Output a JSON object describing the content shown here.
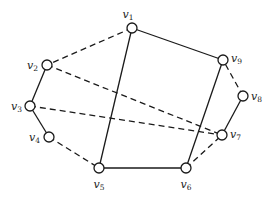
{
  "diagram": {
    "type": "graph",
    "nodes": [
      {
        "id": "v1",
        "label": "v",
        "subscript": "1"
      },
      {
        "id": "v2",
        "label": "v",
        "subscript": "2"
      },
      {
        "id": "v3",
        "label": "v",
        "subscript": "3"
      },
      {
        "id": "v4",
        "label": "v",
        "subscript": "4"
      },
      {
        "id": "v5",
        "label": "v",
        "subscript": "5"
      },
      {
        "id": "v6",
        "label": "v",
        "subscript": "6"
      },
      {
        "id": "v7",
        "label": "v",
        "subscript": "7"
      },
      {
        "id": "v8",
        "label": "v",
        "subscript": "8"
      },
      {
        "id": "v9",
        "label": "v",
        "subscript": "9"
      }
    ],
    "edges": [
      {
        "from": "v1",
        "to": "v2",
        "style": "dashed"
      },
      {
        "from": "v1",
        "to": "v9",
        "style": "solid"
      },
      {
        "from": "v1",
        "to": "v5",
        "style": "solid"
      },
      {
        "from": "v2",
        "to": "v3",
        "style": "solid"
      },
      {
        "from": "v2",
        "to": "v7",
        "style": "dashed"
      },
      {
        "from": "v3",
        "to": "v4",
        "style": "solid"
      },
      {
        "from": "v3",
        "to": "v7",
        "style": "dashed"
      },
      {
        "from": "v4",
        "to": "v5",
        "style": "dashed"
      },
      {
        "from": "v5",
        "to": "v6",
        "style": "solid"
      },
      {
        "from": "v6",
        "to": "v9",
        "style": "solid"
      },
      {
        "from": "v6",
        "to": "v7",
        "style": "dashed"
      },
      {
        "from": "v7",
        "to": "v8",
        "style": "solid"
      },
      {
        "from": "v8",
        "to": "v9",
        "style": "dashed"
      }
    ]
  }
}
